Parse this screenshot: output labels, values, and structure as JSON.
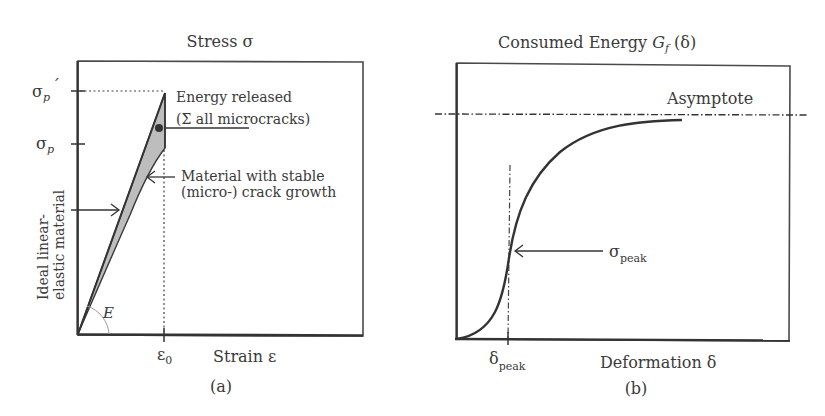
{
  "panel_a": {
    "title": "Stress σ",
    "x_label": "Strain ε",
    "caption": "(a)",
    "y_ticks": [
      {
        "base": "σ",
        "sub": "p",
        "prime": "´"
      },
      {
        "base": "σ",
        "sub": "p",
        "prime": ""
      }
    ],
    "x_tick": {
      "base": "ε",
      "sub": "0"
    },
    "angle_label": "E",
    "annotation_energy": [
      "Energy released",
      "(Σ all microcracks)"
    ],
    "annotation_material": [
      "Material with stable",
      "(micro-) crack growth"
    ],
    "annotation_ideal": [
      "Ideal linear-",
      "elastic material"
    ]
  },
  "panel_b": {
    "title_prefix": "Consumed Energy ",
    "title_symbol": "G",
    "title_sub": "f",
    "title_suffix": " (δ)",
    "x_label": "Deformation δ",
    "caption": "(b)",
    "asymptote_label": "Asymptote",
    "x_tick": {
      "base": "δ",
      "sub": "peak"
    },
    "peak_annotation": {
      "base": "σ",
      "sub": "peak"
    }
  },
  "colors": {
    "line": "#3a3a3a",
    "fill": "#bdbdbd",
    "arc": "#9a9a9a"
  }
}
